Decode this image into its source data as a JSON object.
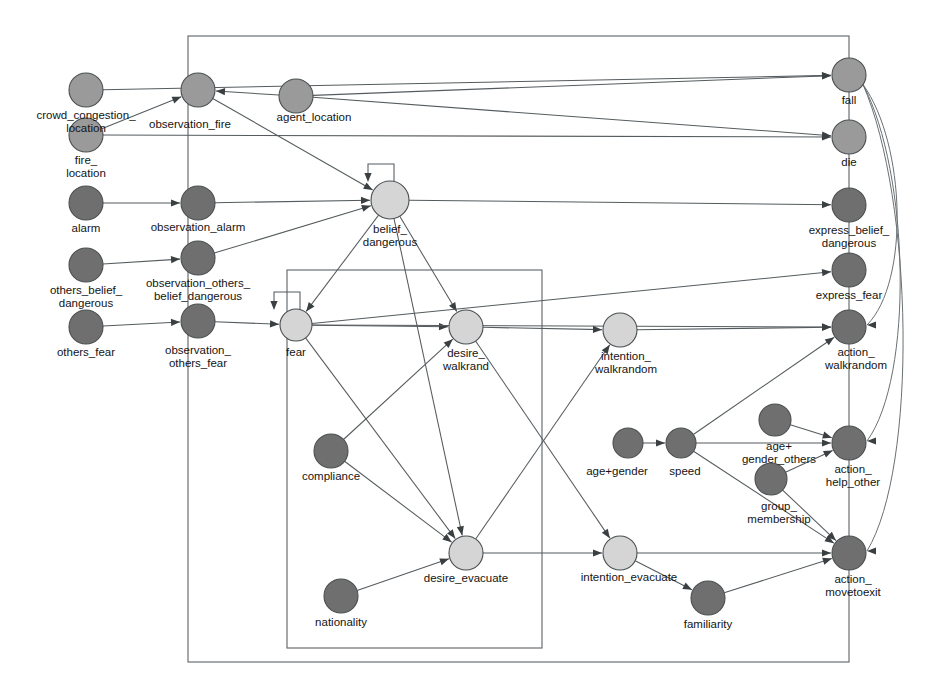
{
  "diagram": {
    "palette": {
      "node_light": "#d5d5d5",
      "node_mid": "#9a9a9a",
      "node_dark": "#6f6f6f",
      "edge": "#555b5e",
      "box": "#5d6366",
      "label": "#141414",
      "background": "#ffffff"
    },
    "nodes": [
      {
        "id": "crowd_congestion_location",
        "label": "crowd_congestion_\nlocation",
        "x": 86,
        "y": 90,
        "r": 17,
        "shade": "node_mid",
        "label_x": 86,
        "label_y": 116,
        "label_anchor": "middle"
      },
      {
        "id": "fire_location",
        "label": "fire_\nlocation",
        "x": 86,
        "y": 135,
        "r": 17,
        "shade": "node_mid",
        "label_x": 86,
        "label_y": 161,
        "label_anchor": "middle"
      },
      {
        "id": "alarm",
        "label": "alarm",
        "x": 86,
        "y": 203,
        "r": 17,
        "shade": "node_dark",
        "label_x": 86,
        "label_y": 229,
        "label_anchor": "middle"
      },
      {
        "id": "others_belief_dangerous",
        "label": "others_belief_\ndangerous",
        "x": 86,
        "y": 265,
        "r": 17,
        "shade": "node_dark",
        "label_x": 86,
        "label_y": 291,
        "label_anchor": "middle"
      },
      {
        "id": "others_fear",
        "label": "others_fear",
        "x": 86,
        "y": 327,
        "r": 17,
        "shade": "node_dark",
        "label_x": 86,
        "label_y": 353,
        "label_anchor": "middle"
      },
      {
        "id": "observation_fire",
        "label": "observation_fire",
        "x": 198,
        "y": 90,
        "r": 17,
        "shade": "node_mid",
        "label_x": 190,
        "label_y": 125,
        "label_anchor": "middle"
      },
      {
        "id": "observation_alarm",
        "label": "observation_alarm",
        "x": 198,
        "y": 203,
        "r": 17,
        "shade": "node_dark",
        "label_x": 198,
        "label_y": 228,
        "label_anchor": "middle"
      },
      {
        "id": "observation_others_belief_dangerous",
        "label": "observation_others_\nbelief_dangerous",
        "x": 198,
        "y": 258,
        "r": 17,
        "shade": "node_dark",
        "label_x": 198,
        "label_y": 284,
        "label_anchor": "middle"
      },
      {
        "id": "observation_others_fear",
        "label": "observation_\nothers_fear",
        "x": 198,
        "y": 321,
        "r": 17,
        "shade": "node_dark",
        "label_x": 198,
        "label_y": 351,
        "label_anchor": "middle"
      },
      {
        "id": "agent_location",
        "label": "agent_location",
        "x": 296,
        "y": 96,
        "r": 17,
        "shade": "node_mid",
        "label_x": 314,
        "label_y": 118,
        "label_anchor": "middle"
      },
      {
        "id": "belief_dangerous",
        "label": "belief_\ndangerous",
        "x": 390,
        "y": 200,
        "r": 19,
        "shade": "node_light",
        "label_x": 390,
        "label_y": 230,
        "label_anchor": "middle"
      },
      {
        "id": "fear",
        "label": "fear",
        "x": 296,
        "y": 325,
        "r": 16,
        "shade": "node_light",
        "label_x": 296,
        "label_y": 353,
        "label_anchor": "middle"
      },
      {
        "id": "compliance",
        "label": "compliance",
        "x": 331,
        "y": 451,
        "r": 17,
        "shade": "node_dark",
        "label_x": 331,
        "label_y": 477,
        "label_anchor": "middle"
      },
      {
        "id": "nationality",
        "label": "nationality",
        "x": 341,
        "y": 596,
        "r": 17,
        "shade": "node_dark",
        "label_x": 341,
        "label_y": 623,
        "label_anchor": "middle"
      },
      {
        "id": "desire_walkrand",
        "label": "desire_\nwalkrand",
        "x": 466,
        "y": 327,
        "r": 17,
        "shade": "node_light",
        "label_x": 466,
        "label_y": 354,
        "label_anchor": "middle"
      },
      {
        "id": "desire_evacuate",
        "label": "desire_evacuate",
        "x": 466,
        "y": 553,
        "r": 17,
        "shade": "node_light",
        "label_x": 466,
        "label_y": 579,
        "label_anchor": "middle"
      },
      {
        "id": "intention_walkrandom",
        "label": "intention_\nwalkrandom",
        "x": 620,
        "y": 330,
        "r": 17,
        "shade": "node_light",
        "label_x": 626,
        "label_y": 357,
        "label_anchor": "middle"
      },
      {
        "id": "intention_evacuate",
        "label": "intention_evacuate",
        "x": 620,
        "y": 553,
        "r": 17,
        "shade": "node_light",
        "label_x": 629,
        "label_y": 578,
        "label_anchor": "middle"
      },
      {
        "id": "age_gender",
        "label": "age+gender",
        "x": 628,
        "y": 443,
        "r": 15,
        "shade": "node_dark",
        "label_x": 617,
        "label_y": 472,
        "label_anchor": "middle"
      },
      {
        "id": "speed",
        "label": "speed",
        "x": 681,
        "y": 443,
        "r": 15,
        "shade": "node_dark",
        "label_x": 685,
        "label_y": 472,
        "label_anchor": "middle"
      },
      {
        "id": "age_gender_others",
        "label": "age+\ngender_others",
        "x": 775,
        "y": 420,
        "r": 16,
        "shade": "node_dark",
        "label_x": 779,
        "label_y": 447,
        "label_anchor": "middle"
      },
      {
        "id": "group_membership",
        "label": "group_\nmembership",
        "x": 771,
        "y": 479,
        "r": 16,
        "shade": "node_dark",
        "label_x": 779,
        "label_y": 507,
        "label_anchor": "middle"
      },
      {
        "id": "familiarity",
        "label": "familiarity",
        "x": 708,
        "y": 598,
        "r": 17,
        "shade": "node_dark",
        "label_x": 708,
        "label_y": 625,
        "label_anchor": "middle"
      },
      {
        "id": "fall",
        "label": "fall",
        "x": 849,
        "y": 75,
        "r": 17,
        "shade": "node_mid",
        "label_x": 849,
        "label_y": 101,
        "label_anchor": "middle"
      },
      {
        "id": "die",
        "label": "die",
        "x": 849,
        "y": 137,
        "r": 17,
        "shade": "node_mid",
        "label_x": 849,
        "label_y": 163,
        "label_anchor": "middle"
      },
      {
        "id": "express_belief_dangerous",
        "label": "express_belief_\ndangerous",
        "x": 849,
        "y": 205,
        "r": 17,
        "shade": "node_dark",
        "label_x": 849,
        "label_y": 231,
        "label_anchor": "middle"
      },
      {
        "id": "express_fear",
        "label": "express_fear",
        "x": 849,
        "y": 270,
        "r": 17,
        "shade": "node_dark",
        "label_x": 849,
        "label_y": 296,
        "label_anchor": "middle"
      },
      {
        "id": "action_walkrandom",
        "label": "action_\nwalkrandom",
        "x": 849,
        "y": 327,
        "r": 17,
        "shade": "node_dark",
        "label_x": 856,
        "label_y": 353,
        "label_anchor": "middle"
      },
      {
        "id": "action_help_other",
        "label": "action_\nhelp_other",
        "x": 849,
        "y": 443,
        "r": 17,
        "shade": "node_dark",
        "label_x": 853,
        "label_y": 470,
        "label_anchor": "middle"
      },
      {
        "id": "action_movetoexit",
        "label": "action_\nmovetoexit",
        "x": 849,
        "y": 553,
        "r": 17,
        "shade": "node_dark",
        "label_x": 853,
        "label_y": 580,
        "label_anchor": "middle"
      }
    ],
    "containers": [
      {
        "id": "outer-boundary",
        "x": 188,
        "y": 36,
        "width": 661,
        "height": 626
      },
      {
        "id": "inner-boundary",
        "x": 287,
        "y": 270,
        "width": 255,
        "height": 378
      }
    ],
    "edges": [
      {
        "from": "crowd_congestion_location",
        "to": "fall"
      },
      {
        "from": "fire_location",
        "to": "observation_fire"
      },
      {
        "from": "fire_location",
        "to": "die"
      },
      {
        "from": "alarm",
        "to": "observation_alarm"
      },
      {
        "from": "others_belief_dangerous",
        "to": "observation_others_belief_dangerous"
      },
      {
        "from": "others_fear",
        "to": "observation_others_fear"
      },
      {
        "from": "agent_location",
        "to": "observation_fire"
      },
      {
        "from": "agent_location",
        "to": "fall"
      },
      {
        "from": "agent_location",
        "to": "die"
      },
      {
        "from": "observation_fire",
        "to": "belief_dangerous"
      },
      {
        "from": "observation_alarm",
        "to": "belief_dangerous"
      },
      {
        "from": "observation_others_belief_dangerous",
        "to": "belief_dangerous"
      },
      {
        "from": "observation_others_fear",
        "to": "fear"
      },
      {
        "from": "belief_dangerous",
        "to": "belief_dangerous",
        "self_loop": true
      },
      {
        "from": "belief_dangerous",
        "to": "express_belief_dangerous"
      },
      {
        "from": "belief_dangerous",
        "to": "fear"
      },
      {
        "from": "belief_dangerous",
        "to": "desire_walkrand"
      },
      {
        "from": "belief_dangerous",
        "to": "desire_evacuate"
      },
      {
        "from": "fear",
        "to": "fear",
        "self_loop": true
      },
      {
        "from": "fear",
        "to": "express_fear"
      },
      {
        "from": "fear",
        "to": "desire_walkrand"
      },
      {
        "from": "fear",
        "to": "desire_evacuate"
      },
      {
        "from": "fear",
        "to": "action_walkrandom"
      },
      {
        "from": "compliance",
        "to": "desire_walkrand"
      },
      {
        "from": "compliance",
        "to": "desire_evacuate"
      },
      {
        "from": "nationality",
        "to": "desire_evacuate"
      },
      {
        "from": "desire_walkrand",
        "to": "intention_walkrandom"
      },
      {
        "from": "desire_walkrand",
        "to": "intention_evacuate"
      },
      {
        "from": "desire_evacuate",
        "to": "intention_walkrandom"
      },
      {
        "from": "desire_evacuate",
        "to": "intention_evacuate"
      },
      {
        "from": "intention_walkrandom",
        "to": "action_walkrandom"
      },
      {
        "from": "intention_evacuate",
        "to": "action_movetoexit"
      },
      {
        "from": "intention_evacuate",
        "to": "familiarity"
      },
      {
        "from": "age_gender",
        "to": "speed"
      },
      {
        "from": "speed",
        "to": "action_walkrandom"
      },
      {
        "from": "speed",
        "to": "action_help_other"
      },
      {
        "from": "speed",
        "to": "action_movetoexit"
      },
      {
        "from": "age_gender_others",
        "to": "action_help_other"
      },
      {
        "from": "group_membership",
        "to": "action_help_other"
      },
      {
        "from": "group_membership",
        "to": "action_movetoexit"
      },
      {
        "from": "familiarity",
        "to": "action_movetoexit"
      },
      {
        "from": "fall",
        "to": "action_walkrandom",
        "curved": true
      },
      {
        "from": "fall",
        "to": "action_help_other",
        "curved": true
      },
      {
        "from": "fall",
        "to": "action_movetoexit",
        "curved": true
      }
    ]
  }
}
